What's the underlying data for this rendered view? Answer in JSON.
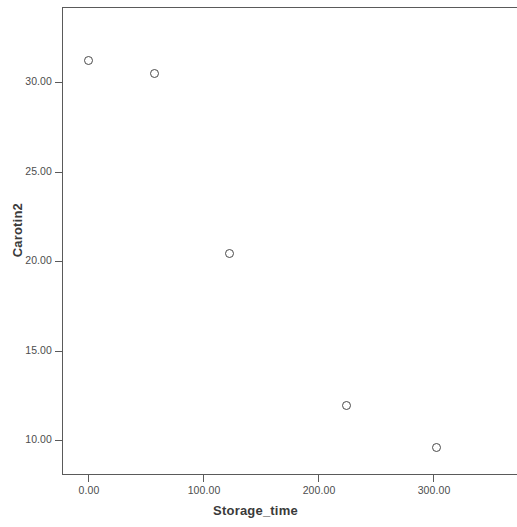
{
  "chart_data": {
    "type": "scatter",
    "title": "",
    "xlabel": "Storage_time",
    "ylabel": "Carotin2",
    "xlim": [
      -12,
      378
    ],
    "ylim": [
      8.7,
      34.8
    ],
    "xticks": [
      0,
      100,
      200,
      300
    ],
    "xtick_labels": [
      "0.00",
      "100.00",
      "200.00",
      "300.00"
    ],
    "yticks": [
      10,
      15,
      20,
      25,
      30
    ],
    "ytick_labels": [
      "10.00",
      "15.00",
      "20.00",
      "25.00",
      "30.00"
    ],
    "grid": false,
    "legend": null,
    "marker_style": "open-circle",
    "marker_color": "#4a4a4a",
    "axis_color": "#5a5a5a",
    "background": "#ffffff",
    "x": [
      0,
      58,
      123,
      225,
      303
    ],
    "y": [
      31.2,
      30.5,
      20.4,
      11.9,
      9.6
    ],
    "points": [
      {
        "x": 0,
        "y": 31.2
      },
      {
        "x": 58,
        "y": 30.5
      },
      {
        "x": 123,
        "y": 20.4
      },
      {
        "x": 225,
        "y": 11.9
      },
      {
        "x": 303,
        "y": 9.6
      }
    ]
  }
}
